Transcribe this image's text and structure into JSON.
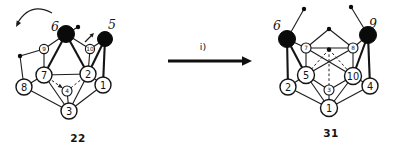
{
  "reaction": {
    "arrow_label": "i)"
  },
  "structures": [
    {
      "compound_label": "22",
      "label_pos": {
        "x": 78,
        "y": 138
      },
      "callouts": [
        {
          "text": "6",
          "x": 55,
          "y": 26
        },
        {
          "text": "5",
          "x": 112,
          "y": 24
        }
      ],
      "vertices": [
        {
          "n": "6",
          "type": "filled",
          "x": 66,
          "y": 34,
          "r": 8.5
        },
        {
          "n": "5",
          "type": "filled",
          "x": 105,
          "y": 39,
          "r": 7.5
        },
        {
          "n": "9",
          "type": "small",
          "x": 44,
          "y": 49,
          "r": 4.6
        },
        {
          "n": "10",
          "type": "small",
          "x": 90,
          "y": 49,
          "r": 4.6
        },
        {
          "n": "7",
          "type": "large",
          "x": 44,
          "y": 75,
          "r": 8
        },
        {
          "n": "2",
          "type": "large",
          "x": 88,
          "y": 74,
          "r": 8
        },
        {
          "n": "8",
          "type": "large",
          "x": 24,
          "y": 87,
          "r": 8
        },
        {
          "n": "1",
          "type": "large",
          "x": 103,
          "y": 85,
          "r": 8
        },
        {
          "n": "4",
          "type": "small",
          "x": 67,
          "y": 91,
          "r": 5
        },
        {
          "n": "3",
          "type": "large",
          "x": 69,
          "y": 111,
          "r": 8
        }
      ],
      "dots": [
        {
          "id": "mL",
          "x": 20,
          "y": 56
        },
        {
          "id": "m6",
          "x": 78,
          "y": 27
        }
      ],
      "edges": [
        {
          "from": "9",
          "to": "6",
          "style": "thin"
        },
        {
          "from": "6",
          "to": "10",
          "style": "thin"
        },
        {
          "from": "10",
          "to": "5",
          "style": "thin"
        },
        {
          "from": "9",
          "to": "7",
          "style": "thin"
        },
        {
          "from": "10",
          "to": "2",
          "style": "thin"
        },
        {
          "from": "7",
          "to": "2",
          "style": "thin"
        },
        {
          "from": "7",
          "to": "8",
          "style": "thin"
        },
        {
          "from": "7",
          "to": "3",
          "style": "thin"
        },
        {
          "from": "2",
          "to": "3",
          "style": "thin"
        },
        {
          "from": "2",
          "to": "1",
          "style": "thin"
        },
        {
          "from": "8",
          "to": "3",
          "style": "thin"
        },
        {
          "from": "1",
          "to": "3",
          "style": "thin"
        },
        {
          "from": "3",
          "to": "4",
          "style": "thin"
        },
        {
          "from": "mL",
          "to": "9",
          "style": "thin"
        },
        {
          "from": "mL",
          "to": "8",
          "style": "thin"
        },
        {
          "from": "m6",
          "to": "6",
          "style": "thin"
        },
        {
          "from": "6",
          "to": "7",
          "style": "thick"
        },
        {
          "from": "6",
          "to": "2",
          "style": "thick"
        },
        {
          "from": "5",
          "to": "2",
          "style": "thick"
        },
        {
          "from": "5",
          "to": "1",
          "style": "thick"
        },
        {
          "from": "7",
          "to": "4",
          "style": "dashed"
        },
        {
          "from": "4",
          "to": "2",
          "style": "dashed"
        }
      ]
    },
    {
      "compound_label": "31",
      "label_pos": {
        "x": 331,
        "y": 133
      },
      "callouts": [
        {
          "text": "6",
          "x": 277,
          "y": 25
        },
        {
          "text": "9",
          "x": 373,
          "y": 23
        }
      ],
      "vertices": [
        {
          "n": "6",
          "type": "filled",
          "x": 287,
          "y": 39,
          "r": 8.5
        },
        {
          "n": "9",
          "type": "filled",
          "x": 368,
          "y": 35,
          "r": 8.5
        },
        {
          "n": "7",
          "type": "small",
          "x": 306,
          "y": 48,
          "r": 5
        },
        {
          "n": "8",
          "type": "small",
          "x": 353,
          "y": 48,
          "r": 5
        },
        {
          "n": "5",
          "type": "large",
          "x": 306,
          "y": 75,
          "r": 8.5
        },
        {
          "n": "10",
          "type": "large",
          "x": 353,
          "y": 76,
          "r": 8.5
        },
        {
          "n": "2",
          "type": "large",
          "x": 288,
          "y": 87,
          "r": 8
        },
        {
          "n": "4",
          "type": "large",
          "x": 370,
          "y": 86,
          "r": 8
        },
        {
          "n": "3",
          "type": "small",
          "x": 329,
          "y": 90,
          "r": 5
        },
        {
          "n": "1",
          "type": "large",
          "x": 329,
          "y": 108,
          "r": 8.5
        }
      ],
      "dots": [
        {
          "id": "m6r",
          "x": 304,
          "y": 9
        },
        {
          "id": "m9",
          "x": 351,
          "y": 7
        },
        {
          "id": "top",
          "x": 329,
          "y": 29
        },
        {
          "id": "mid",
          "x": 329,
          "y": 49.5
        }
      ],
      "edges": [
        {
          "from": "m6r",
          "to": "6",
          "style": "thin"
        },
        {
          "from": "m9",
          "to": "9",
          "style": "thin"
        },
        {
          "from": "6",
          "to": "7",
          "style": "thin"
        },
        {
          "from": "9",
          "to": "8",
          "style": "thin"
        },
        {
          "from": "top",
          "to": "7",
          "style": "thin"
        },
        {
          "from": "top",
          "to": "8",
          "style": "thin"
        },
        {
          "from": "7",
          "to": "8",
          "style": "thin"
        },
        {
          "from": "7",
          "to": "5",
          "style": "thin"
        },
        {
          "from": "8",
          "to": "10",
          "style": "thin"
        },
        {
          "from": "7",
          "to": "10",
          "style": "thin"
        },
        {
          "from": "8",
          "to": "5",
          "style": "thin"
        },
        {
          "from": "2",
          "to": "5",
          "style": "thin"
        },
        {
          "from": "4",
          "to": "10",
          "style": "thin"
        },
        {
          "from": "2",
          "to": "1",
          "style": "thin"
        },
        {
          "from": "4",
          "to": "1",
          "style": "thin"
        },
        {
          "from": "5",
          "to": "3",
          "style": "thin"
        },
        {
          "from": "10",
          "to": "3",
          "style": "thin"
        },
        {
          "from": "3",
          "to": "1",
          "style": "thin"
        },
        {
          "from": "5",
          "to": "1",
          "style": "thin"
        },
        {
          "from": "10",
          "to": "1",
          "style": "thin"
        },
        {
          "from": "6",
          "to": "5",
          "style": "thick"
        },
        {
          "from": "6",
          "to": "2",
          "style": "thick"
        },
        {
          "from": "9",
          "to": "10",
          "style": "thick"
        },
        {
          "from": "9",
          "to": "4",
          "style": "thick"
        },
        {
          "from": "mid",
          "to": "5",
          "style": "dashed"
        },
        {
          "from": "mid",
          "to": "10",
          "style": "dashed"
        },
        {
          "from": "mid",
          "to": "3",
          "style": "dashed"
        }
      ]
    }
  ]
}
